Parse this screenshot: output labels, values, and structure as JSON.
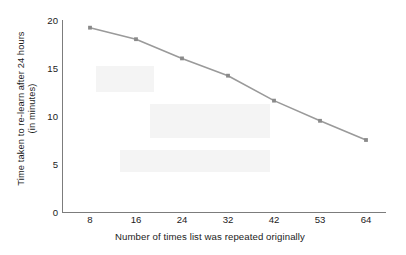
{
  "chart_data": {
    "type": "line",
    "title": "",
    "xlabel": "Number of times list was repeated originally",
    "ylabel": "Time taken to re-learn after 24 hours\n(in minutes)",
    "categories": [
      "8",
      "16",
      "24",
      "32",
      "42",
      "53",
      "64"
    ],
    "values": [
      19.2,
      18.0,
      16.0,
      14.2,
      11.6,
      9.5,
      7.5
    ],
    "series": [
      {
        "name": "Time to re-learn",
        "values": [
          19.2,
          18.0,
          16.0,
          14.2,
          11.6,
          9.5,
          7.5
        ]
      }
    ],
    "y_ticks": [
      0,
      5,
      10,
      15,
      20
    ],
    "y_tick_labels": [
      "0",
      "5",
      "10",
      "15",
      "20"
    ],
    "ylim": [
      0,
      20
    ],
    "x_tick_labels": [
      "8",
      "16",
      "24",
      "32",
      "42",
      "53",
      "64"
    ],
    "grid": false,
    "legend": false,
    "legend_position": "none",
    "line_color": "#9a9a9a",
    "marker_color": "#8a8a8a",
    "axis_color": "#7c7c7c",
    "text_color": "#1b1b1b",
    "background_color": "#ffffff",
    "marker": "square"
  }
}
